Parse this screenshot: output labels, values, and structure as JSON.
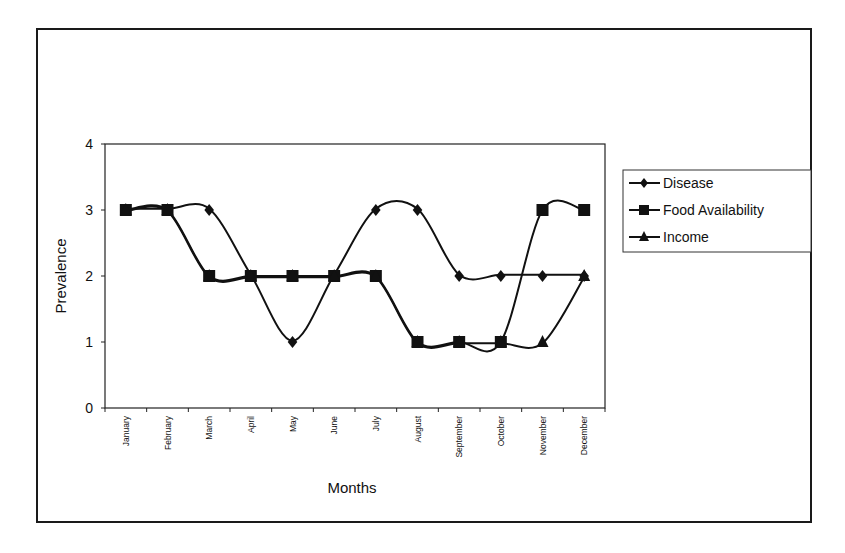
{
  "chart_data": {
    "type": "line",
    "title": "",
    "xlabel": "Months",
    "ylabel": "Prevalence",
    "ylim": [
      0,
      4
    ],
    "yticks": [
      0,
      1,
      2,
      3,
      4
    ],
    "grid": false,
    "smoothed": true,
    "legend_position": "right",
    "categories": [
      "January",
      "February",
      "March",
      "April",
      "May",
      "June",
      "July",
      "August",
      "September",
      "October",
      "November",
      "December"
    ],
    "series": [
      {
        "name": "Disease",
        "marker": "diamond",
        "values": [
          3,
          3,
          3,
          2,
          1,
          2,
          3,
          3,
          2,
          2,
          2,
          2
        ]
      },
      {
        "name": "Food Availability",
        "marker": "square",
        "values": [
          3,
          3,
          2,
          2,
          2,
          2,
          2,
          1,
          1,
          1,
          3,
          3
        ]
      },
      {
        "name": "Income",
        "marker": "triangle",
        "values": [
          3,
          3,
          2,
          2,
          2,
          2,
          2,
          1,
          1,
          1,
          1,
          2
        ]
      }
    ]
  },
  "colors": {
    "line": "#111111",
    "frame": "#1a1a1a",
    "background": "#ffffff"
  }
}
